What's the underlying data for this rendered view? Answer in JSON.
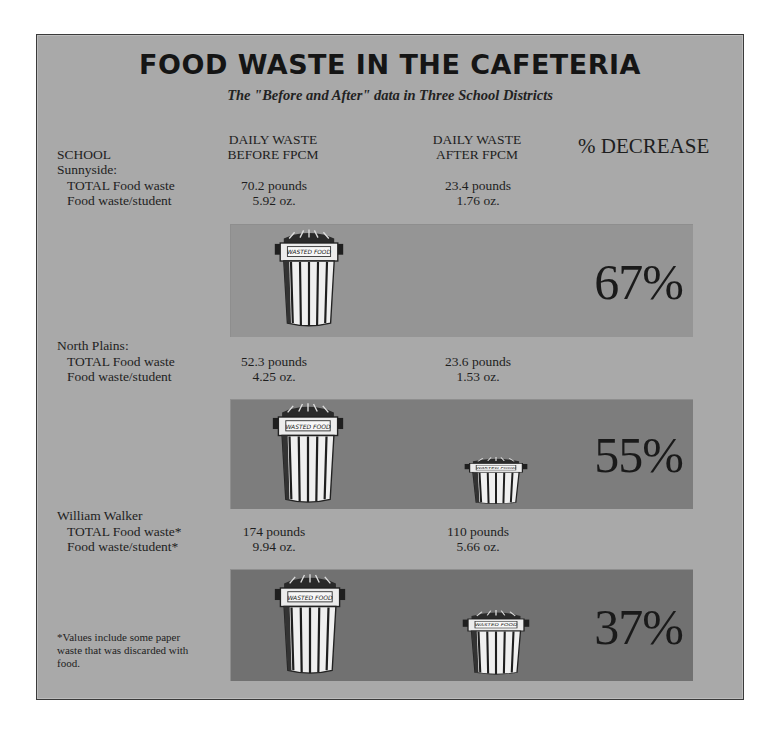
{
  "title": "FOOD WASTE IN THE CAFETERIA",
  "subtitle": "The \"Before and After\" data in Three School Districts",
  "headers": {
    "school": "SCHOOL",
    "before_line1": "DAILY WASTE",
    "before_line2": "BEFORE FPCM",
    "after_line1": "DAILY WASTE",
    "after_line2": "AFTER FPCM",
    "decrease": "% DECREASE"
  },
  "can_label": "WASTED FOOD",
  "schools": [
    {
      "name": "Sunnyside:",
      "total_label": "TOTAL Food waste",
      "student_label": "Food waste/student",
      "before_total": "70.2 pounds",
      "before_student": "5.92 oz.",
      "after_total": "23.4 pounds",
      "after_student": "1.76 oz.",
      "decrease": "67%"
    },
    {
      "name": "North Plains:",
      "total_label": "TOTAL Food waste",
      "student_label": "Food waste/student",
      "before_total": "52.3 pounds",
      "before_student": "4.25 oz.",
      "after_total": "23.6 pounds",
      "after_student": "1.53 oz.",
      "decrease": "55%"
    },
    {
      "name": "William Walker",
      "total_label": "TOTAL Food waste*",
      "student_label": "Food waste/student*",
      "before_total": "174 pounds",
      "before_student": "9.94 oz.",
      "after_total": "110 pounds",
      "after_student": "5.66 oz.",
      "decrease": "37%"
    }
  ],
  "footnote": "*Values include some paper waste that was discarded with food.",
  "colors": {
    "background": "#a9a9a9",
    "panel_1": "#959595",
    "panel_2": "#7d7d7d",
    "panel_3": "#717171",
    "text": "#1e1e1e"
  }
}
